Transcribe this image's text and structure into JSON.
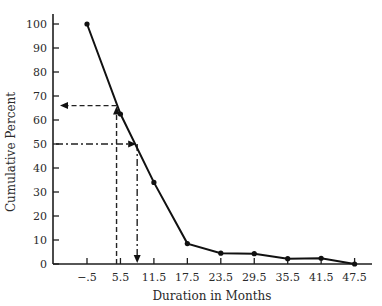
{
  "chart_data": {
    "type": "line",
    "title": "",
    "xlabel": "Duration in Months",
    "ylabel": "Cumulative Percent",
    "x": [
      -0.5,
      5.5,
      11.5,
      17.5,
      23.5,
      29.5,
      35.5,
      41.5,
      47.5
    ],
    "x_tick_labels": [
      "−.5",
      "5.5",
      "11.5",
      "17.5",
      "23.5",
      "29.5",
      "35.5",
      "41.5",
      "47.5"
    ],
    "y_ticks": [
      0,
      10,
      20,
      30,
      40,
      50,
      60,
      70,
      80,
      90,
      100
    ],
    "series": [
      {
        "name": "Cumulative Percent",
        "values": [
          100,
          62.5,
          34,
          8.5,
          4.5,
          4.3,
          2.2,
          2.4,
          0
        ]
      }
    ],
    "ylim": [
      0,
      100
    ],
    "xlim": [
      -6.5,
      51
    ],
    "grid": false,
    "legend": null,
    "annotations": [
      {
        "style": "dashed",
        "description": "Horizontal arrow at 66% pointing to y-axis; vertical line at ~4.8 months from x-axis up to curve",
        "x": 4.8,
        "y": 66
      },
      {
        "style": "dash-dot",
        "description": "Horizontal arrow from y-axis at 50% to curve; vertical arrow down to x-axis at ~8.5 months",
        "x": 8.5,
        "y": 50
      }
    ]
  },
  "axes": {
    "x_title": "Duration in Months",
    "y_title": "Cumulative Percent"
  }
}
